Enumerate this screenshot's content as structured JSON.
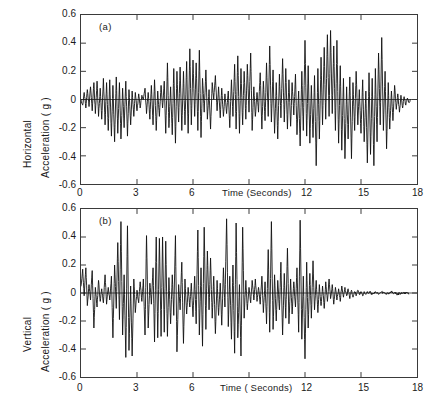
{
  "figure": {
    "background": "#ffffff",
    "trace_color": "#111111",
    "axis_color": "#3a3a3a",
    "zero_line_color": "#3a3a3a"
  },
  "panels": [
    {
      "id": "a",
      "letter": "(a)",
      "ylabel_line1": "Horizontal",
      "ylabel_line2": "Acceleration ( g )",
      "xlabel": "Time (Seconds)",
      "yticks": [
        "0.6",
        "0.4",
        "0.2",
        "0",
        "-0.2",
        "-0.4",
        "-0.6"
      ],
      "xticks": [
        "0",
        "3",
        "6",
        "12",
        "15",
        "18"
      ]
    },
    {
      "id": "b",
      "letter": "(b)",
      "ylabel_line1": "Vertical",
      "ylabel_line2": "Acceleration ( g )",
      "xlabel": "Time ( Seconds)",
      "yticks": [
        "0.6",
        "0.4",
        "0.2",
        "0",
        "-0.2",
        "-0.4",
        "-0.6"
      ],
      "xticks": [
        "0",
        "3",
        "6",
        "12",
        "15",
        "18"
      ]
    }
  ],
  "chart_data": [
    {
      "type": "line",
      "title": "(a) Horizontal component accelerogram",
      "xlabel": "Time (Seconds)",
      "ylabel": "Horizontal Acceleration ( g )",
      "xlim": [
        0,
        18
      ],
      "ylim": [
        -0.6,
        0.6
      ],
      "xticks": [
        0,
        3,
        6,
        9,
        12,
        15,
        18
      ],
      "yticks": [
        -0.6,
        -0.4,
        -0.2,
        0,
        0.2,
        0.4,
        0.6
      ],
      "xtick_labels": [
        "0",
        "3",
        "6",
        "",
        "12",
        "15",
        "18"
      ],
      "ytick_labels": [
        "-0.6",
        "-0.4",
        "-0.2",
        "0",
        "0.2",
        "0.4",
        "0.6"
      ],
      "grid": false,
      "legend": "none",
      "zero_line": true,
      "series": [
        {
          "name": "Horizontal acceleration",
          "x": [
            0.0,
            0.09,
            0.17,
            0.26,
            0.34,
            0.43,
            0.51,
            0.6,
            0.69,
            0.77,
            0.86,
            0.94,
            1.03,
            1.11,
            1.2,
            1.29,
            1.37,
            1.46,
            1.54,
            1.63,
            1.71,
            1.8,
            1.89,
            1.97,
            2.06,
            2.14,
            2.23,
            2.31,
            2.4,
            2.49,
            2.57,
            2.66,
            2.74,
            2.83,
            2.91,
            3.0,
            3.09,
            3.17,
            3.26,
            3.34,
            3.43,
            3.51,
            3.6,
            3.69,
            3.77,
            3.86,
            3.94,
            4.03,
            4.11,
            4.2,
            4.29,
            4.37,
            4.46,
            4.54,
            4.63,
            4.71,
            4.8,
            4.89,
            4.97,
            5.06,
            5.14,
            5.23,
            5.31,
            5.4,
            5.49,
            5.57,
            5.66,
            5.74,
            5.83,
            5.91,
            6.0,
            6.09,
            6.17,
            6.26,
            6.34,
            6.43,
            6.51,
            6.6,
            6.69,
            6.77,
            6.86,
            6.94,
            7.03,
            7.11,
            7.2,
            7.29,
            7.37,
            7.46,
            7.54,
            7.63,
            7.71,
            7.8,
            7.89,
            7.97,
            8.06,
            8.14,
            8.23,
            8.31,
            8.4,
            8.49,
            8.57,
            8.66,
            8.74,
            8.83,
            8.91,
            9.0,
            9.09,
            9.17,
            9.26,
            9.34,
            9.43,
            9.51,
            9.6,
            9.69,
            9.77,
            9.86,
            9.94,
            10.03,
            10.11,
            10.2,
            10.29,
            10.37,
            10.46,
            10.54,
            10.63,
            10.71,
            10.8,
            10.89,
            10.97,
            11.06,
            11.14,
            11.23,
            11.31,
            11.4,
            11.49,
            11.57,
            11.66,
            11.74,
            11.83,
            11.91,
            12.0,
            12.09,
            12.17,
            12.26,
            12.34,
            12.43,
            12.51,
            12.6,
            12.69,
            12.77,
            12.86,
            12.94,
            13.03,
            13.11,
            13.2,
            13.29,
            13.37,
            13.46,
            13.54,
            13.63,
            13.71,
            13.8,
            13.89,
            13.97,
            14.06,
            14.14,
            14.23,
            14.31,
            14.4,
            14.49,
            14.57,
            14.66,
            14.74,
            14.83,
            14.91,
            15.0,
            15.09,
            15.17,
            15.26,
            15.34,
            15.43,
            15.51,
            15.6,
            15.69,
            15.77,
            15.86,
            15.94,
            16.03,
            16.11,
            16.2,
            16.29,
            16.37,
            16.46,
            16.54,
            16.63,
            16.71,
            16.8,
            16.89,
            16.97,
            17.06,
            17.14,
            17.23,
            17.31,
            17.4,
            17.49,
            17.57,
            17.66,
            17.74,
            17.83,
            17.91,
            18.0
          ],
          "y": [
            0.0,
            -0.04,
            0.05,
            -0.06,
            0.07,
            -0.05,
            0.09,
            -0.08,
            0.12,
            -0.1,
            0.13,
            -0.12,
            0.08,
            -0.14,
            0.15,
            -0.18,
            0.12,
            -0.22,
            0.14,
            -0.26,
            0.1,
            -0.3,
            0.16,
            -0.24,
            0.12,
            -0.28,
            0.08,
            -0.2,
            0.13,
            -0.26,
            0.07,
            -0.18,
            0.06,
            -0.12,
            0.05,
            -0.08,
            0.04,
            -0.06,
            0.03,
            0.0,
            0.08,
            -0.1,
            0.05,
            -0.14,
            0.1,
            -0.18,
            0.14,
            -0.22,
            0.06,
            -0.12,
            0.1,
            -0.06,
            0.13,
            -0.24,
            0.26,
            -0.2,
            0.09,
            -0.25,
            0.22,
            -0.31,
            0.2,
            -0.16,
            0.23,
            -0.22,
            0.2,
            -0.18,
            0.27,
            -0.24,
            0.36,
            -0.18,
            0.28,
            -0.12,
            0.26,
            -0.22,
            0.35,
            -0.27,
            0.15,
            -0.09,
            0.21,
            -0.14,
            0.07,
            -0.21,
            0.12,
            0.0,
            0.17,
            -0.08,
            0.09,
            -0.13,
            0.08,
            -0.12,
            0.04,
            -0.1,
            0.06,
            -0.2,
            0.14,
            -0.12,
            0.25,
            -0.21,
            0.31,
            -0.24,
            0.22,
            -0.18,
            0.2,
            -0.14,
            0.25,
            -0.09,
            0.33,
            -0.22,
            0.09,
            -0.12,
            0.05,
            -0.09,
            0.19,
            -0.21,
            0.13,
            -0.15,
            0.26,
            -0.12,
            0.38,
            -0.16,
            0.21,
            -0.24,
            0.12,
            -0.28,
            0.18,
            -0.13,
            0.29,
            -0.16,
            0.22,
            -0.21,
            0.14,
            -0.19,
            0.12,
            -0.11,
            0.18,
            -0.25,
            0.06,
            -0.33,
            0.2,
            -0.22,
            0.42,
            -0.26,
            0.24,
            -0.31,
            0.1,
            -0.27,
            0.17,
            -0.47,
            0.22,
            -0.28,
            0.3,
            -0.18,
            0.37,
            -0.14,
            0.46,
            -0.12,
            0.49,
            -0.1,
            0.38,
            -0.22,
            0.42,
            -0.31,
            0.24,
            -0.36,
            0.15,
            -0.42,
            0.09,
            -0.28,
            0.16,
            -0.42,
            0.12,
            -0.22,
            0.2,
            -0.18,
            0.07,
            -0.24,
            0.14,
            -0.3,
            0.06,
            -0.45,
            0.19,
            -0.39,
            0.15,
            -0.47,
            0.22,
            -0.3,
            0.33,
            -0.18,
            0.44,
            -0.22,
            0.2,
            -0.35,
            0.12,
            -0.21,
            0.06,
            -0.15,
            0.1,
            -0.07,
            0.04,
            -0.09,
            0.03,
            -0.06,
            0.02,
            -0.04,
            0.01,
            -0.02,
            0.0
          ]
        }
      ]
    },
    {
      "type": "line",
      "title": "(b) Vertical component accelerogram",
      "xlabel": "Time ( Seconds)",
      "ylabel": "Vertical Acceleration ( g )",
      "xlim": [
        0,
        18
      ],
      "ylim": [
        -0.6,
        0.6
      ],
      "xticks": [
        0,
        3,
        6,
        9,
        12,
        15,
        18
      ],
      "yticks": [
        -0.6,
        -0.4,
        -0.2,
        0,
        0.2,
        0.4,
        0.6
      ],
      "xtick_labels": [
        "0",
        "3",
        "6",
        "",
        "12",
        "15",
        "18"
      ],
      "ytick_labels": [
        "-0.6",
        "-0.4",
        "-0.2",
        "0",
        "0.2",
        "0.4",
        "0.6"
      ],
      "grid": false,
      "legend": "none",
      "zero_line": true,
      "series": [
        {
          "name": "Vertical acceleration",
          "x": [
            0.0,
            0.09,
            0.17,
            0.26,
            0.34,
            0.43,
            0.51,
            0.6,
            0.69,
            0.77,
            0.86,
            0.94,
            1.03,
            1.11,
            1.2,
            1.29,
            1.37,
            1.46,
            1.54,
            1.63,
            1.71,
            1.8,
            1.89,
            1.97,
            2.06,
            2.14,
            2.23,
            2.31,
            2.4,
            2.49,
            2.57,
            2.66,
            2.74,
            2.83,
            2.91,
            3.0,
            3.09,
            3.17,
            3.26,
            3.34,
            3.43,
            3.51,
            3.6,
            3.69,
            3.77,
            3.86,
            3.94,
            4.03,
            4.11,
            4.2,
            4.29,
            4.37,
            4.46,
            4.54,
            4.63,
            4.71,
            4.8,
            4.89,
            4.97,
            5.06,
            5.14,
            5.23,
            5.31,
            5.4,
            5.49,
            5.57,
            5.66,
            5.74,
            5.83,
            5.91,
            6.0,
            6.09,
            6.17,
            6.26,
            6.34,
            6.43,
            6.51,
            6.6,
            6.69,
            6.77,
            6.86,
            6.94,
            7.03,
            7.11,
            7.2,
            7.29,
            7.37,
            7.46,
            7.54,
            7.63,
            7.71,
            7.8,
            7.89,
            7.97,
            8.06,
            8.14,
            8.23,
            8.31,
            8.4,
            8.49,
            8.57,
            8.66,
            8.74,
            8.83,
            8.91,
            9.0,
            9.09,
            9.17,
            9.26,
            9.34,
            9.43,
            9.51,
            9.6,
            9.69,
            9.77,
            9.86,
            9.94,
            10.03,
            10.11,
            10.2,
            10.29,
            10.37,
            10.46,
            10.54,
            10.63,
            10.71,
            10.8,
            10.89,
            10.97,
            11.06,
            11.14,
            11.23,
            11.31,
            11.4,
            11.49,
            11.57,
            11.66,
            11.74,
            11.83,
            11.91,
            12.0,
            12.09,
            12.17,
            12.26,
            12.34,
            12.43,
            12.51,
            12.6,
            12.69,
            12.77,
            12.86,
            12.94,
            13.03,
            13.11,
            13.2,
            13.29,
            13.37,
            13.46,
            13.54,
            13.63,
            13.71,
            13.8,
            13.89,
            13.97,
            14.06,
            14.14,
            14.23,
            14.31,
            14.4,
            14.49,
            14.57,
            14.66,
            14.74,
            14.83,
            14.91,
            15.0,
            15.09,
            15.17,
            15.26,
            15.34,
            15.43,
            15.51,
            15.6,
            15.69,
            15.77,
            15.86,
            15.94,
            16.03,
            16.11,
            16.2,
            16.29,
            16.37,
            16.46,
            16.54,
            16.63,
            16.71,
            16.8,
            16.89,
            16.97,
            17.06,
            17.14,
            17.23,
            17.31,
            17.4,
            17.49,
            17.57,
            17.66,
            17.74,
            17.83,
            17.91,
            18.0
          ],
          "y": [
            0.05,
            0.17,
            -0.02,
            0.18,
            -0.09,
            0.06,
            -0.05,
            0.16,
            -0.25,
            0.04,
            -0.1,
            0.09,
            -0.06,
            0.03,
            -0.07,
            0.13,
            -0.08,
            0.04,
            -0.05,
            0.12,
            -0.32,
            0.2,
            -0.11,
            0.36,
            -0.19,
            0.51,
            -0.3,
            0.13,
            -0.46,
            0.48,
            -0.41,
            0.05,
            -0.45,
            0.1,
            -0.14,
            0.02,
            -0.07,
            0.08,
            -0.06,
            0.1,
            -0.3,
            0.41,
            -0.25,
            0.07,
            -0.08,
            0.18,
            -0.35,
            0.4,
            -0.32,
            0.39,
            -0.31,
            0.4,
            -0.28,
            0.37,
            -0.31,
            0.11,
            -0.22,
            0.13,
            -0.16,
            0.41,
            -0.42,
            0.06,
            -0.12,
            0.22,
            -0.36,
            0.1,
            -0.15,
            0.04,
            -0.1,
            0.07,
            -0.17,
            0.12,
            -0.22,
            0.45,
            -0.3,
            0.18,
            -0.38,
            0.47,
            -0.26,
            0.3,
            -0.12,
            0.25,
            -0.18,
            0.12,
            -0.29,
            0.09,
            -0.16,
            0.07,
            -0.23,
            0.18,
            -0.1,
            0.53,
            -0.24,
            0.12,
            -0.33,
            0.2,
            -0.43,
            0.5,
            -0.32,
            0.06,
            -0.45,
            0.47,
            -0.18,
            0.09,
            -0.12,
            0.04,
            -0.07,
            0.09,
            -0.05,
            0.1,
            -0.06,
            0.04,
            -0.08,
            0.12,
            -0.14,
            0.08,
            -0.22,
            0.31,
            -0.28,
            0.51,
            -0.26,
            0.13,
            -0.2,
            0.09,
            -0.12,
            0.22,
            -0.3,
            0.14,
            -0.18,
            0.32,
            -0.22,
            0.1,
            -0.15,
            0.08,
            -0.1,
            0.18,
            -0.28,
            0.52,
            -0.33,
            0.12,
            -0.47,
            0.22,
            -0.25,
            0.14,
            -0.18,
            0.23,
            -0.12,
            0.09,
            -0.14,
            0.06,
            -0.09,
            0.05,
            -0.11,
            0.08,
            -0.06,
            0.1,
            -0.04,
            0.06,
            -0.08,
            0.04,
            -0.05,
            0.03,
            -0.06,
            0.05,
            -0.03,
            0.04,
            -0.02,
            0.03,
            -0.04,
            0.02,
            -0.03,
            0.01,
            -0.02,
            0.02,
            -0.01,
            0.01,
            -0.02,
            0.01,
            -0.01,
            0.01,
            0.0,
            0.01,
            -0.01,
            0.0,
            0.01,
            0.0,
            -0.01,
            0.0,
            0.01,
            0.0,
            0.0,
            -0.01,
            0.0,
            0.0,
            0.01,
            0.0,
            0.0,
            0.0,
            -0.01,
            0.0,
            0.0,
            0.0,
            0.0,
            0.0,
            0.0,
            0.0
          ]
        }
      ]
    }
  ]
}
